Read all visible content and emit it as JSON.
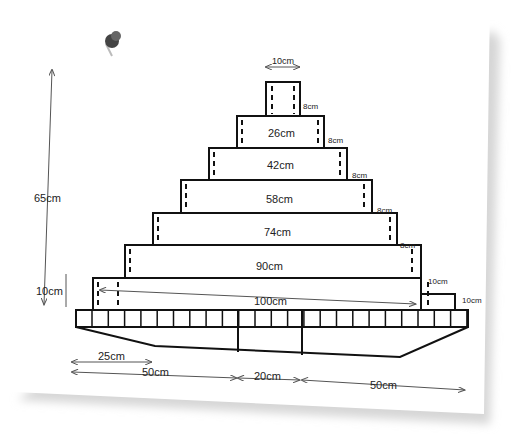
{
  "diagram": {
    "type": "stepped pyramid shelf with base (dimension drawing)",
    "colors": {
      "line": "#111111",
      "dim_line": "#555555",
      "paper": "#ffffff",
      "shadow": "#dcdcdc",
      "pin": "#3a3a3a"
    },
    "decorations": {
      "pushpin": "pushpin-icon"
    },
    "overall": {
      "height_label": "65cm",
      "tier_height_label": "10cm"
    },
    "top_block": {
      "width_label": "10cm"
    },
    "tiers": [
      {
        "width_label": "26cm",
        "step_label": "8cm"
      },
      {
        "width_label": "42cm",
        "step_label": "8cm"
      },
      {
        "width_label": "58cm",
        "step_label": "8cm"
      },
      {
        "width_label": "74cm",
        "step_label": "8cm"
      },
      {
        "width_label": "90cm",
        "step_label": "8cm"
      },
      {
        "width_label": "100cm",
        "step_label": "10cm",
        "side_depth_label": "10cm"
      }
    ],
    "base": {
      "dims": [
        {
          "label": "25cm"
        },
        {
          "label": "50cm"
        },
        {
          "label": "20cm"
        },
        {
          "label": "50cm"
        }
      ]
    }
  }
}
